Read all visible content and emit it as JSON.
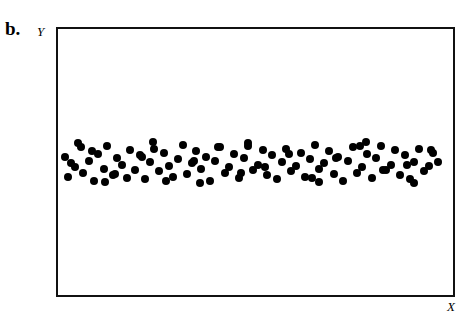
{
  "figure": {
    "panel_letter": "b.",
    "y_axis_label": "Y",
    "x_axis_label": "X",
    "frame_color": "#111111",
    "point_color": "#000000",
    "background_color": "#ffffff"
  },
  "chart_data": {
    "type": "scatter",
    "title": "b.",
    "xlabel": "X",
    "ylabel": "Y",
    "grid": false,
    "legend": null,
    "xlim": [
      0,
      100
    ],
    "ylim": [
      0,
      100
    ],
    "series": [
      {
        "name": "observations",
        "marker": "filled-circle",
        "marker_size_px": 8,
        "color": "#000000",
        "x": [
          1.8,
          2.6,
          4.2,
          5.8,
          6.4,
          7.8,
          9.0,
          10.2,
          11.6,
          12.4,
          13.8,
          15.0,
          16.2,
          17.4,
          18.2,
          19.6,
          20.8,
          22.0,
          23.2,
          24.4,
          25.6,
          26.8,
          28.0,
          29.2,
          30.4,
          31.6,
          32.6,
          33.8,
          35.0,
          36.2,
          37.4,
          38.6,
          39.8,
          41.0,
          42.2,
          43.4,
          44.6,
          45.8,
          47.0,
          48.2,
          49.4,
          50.6,
          51.8,
          53.0,
          54.2,
          55.4,
          56.6,
          57.8,
          59.0,
          60.2,
          61.4,
          62.6,
          63.8,
          65.0,
          66.2,
          67.4,
          68.6,
          69.8,
          71.0,
          72.2,
          73.4,
          74.6,
          75.8,
          77.0,
          78.2,
          79.4,
          80.6,
          81.8,
          83.0,
          84.2,
          85.4,
          86.6,
          87.8,
          89.0,
          90.2,
          91.4,
          92.6,
          93.8,
          95.0,
          96.2,
          3.4,
          8.6,
          14.4,
          21.2,
          27.4,
          34.4,
          40.4,
          46.4,
          52.4,
          58.4,
          64.4,
          70.4,
          76.4,
          82.4,
          88.4,
          94.4,
          5.0,
          12.0,
          24.0,
          36.0,
          48.0,
          66.0,
          78.0,
          90.0
        ],
        "y": [
          52.0,
          44.5,
          48.0,
          55.5,
          46.0,
          50.5,
          43.0,
          53.0,
          47.5,
          56.0,
          45.0,
          51.5,
          49.0,
          44.0,
          54.5,
          47.0,
          52.5,
          43.5,
          50.0,
          55.0,
          46.5,
          53.5,
          48.5,
          44.5,
          51.0,
          56.5,
          45.5,
          49.5,
          54.0,
          47.5,
          52.0,
          43.0,
          50.5,
          55.5,
          46.0,
          48.0,
          53.0,
          44.0,
          51.5,
          56.0,
          47.0,
          49.0,
          54.5,
          45.0,
          52.5,
          43.5,
          50.0,
          55.0,
          46.5,
          48.5,
          53.5,
          44.5,
          51.0,
          56.5,
          47.5,
          49.5,
          54.0,
          45.5,
          52.0,
          43.0,
          50.5,
          55.5,
          46.0,
          48.0,
          53.0,
          44.0,
          51.5,
          56.0,
          47.0,
          49.0,
          54.5,
          45.0,
          52.5,
          43.5,
          50.0,
          55.0,
          46.5,
          48.5,
          53.5,
          50.0,
          49.5,
          54.0,
          45.5,
          52.0,
          43.0,
          50.5,
          55.5,
          46.0,
          48.0,
          53.0,
          44.0,
          51.5,
          56.0,
          47.0,
          49.0,
          54.5,
          57.0,
          42.5,
          57.5,
          42.0,
          57.0,
          42.5,
          57.5,
          42.0
        ]
      }
    ]
  }
}
